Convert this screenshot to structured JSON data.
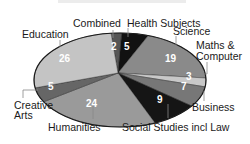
{
  "chart_data": {
    "type": "pie",
    "title": "",
    "unit": "",
    "slices": [
      {
        "label": "Combined",
        "value": 2,
        "color": "#555555"
      },
      {
        "label": "Health Subjects",
        "value": 5,
        "color": "#111111"
      },
      {
        "label": "Science",
        "value": 19,
        "color": "#8a8a8a"
      },
      {
        "label": "Maths & Computer",
        "value": 3,
        "color": "#c8c8c8"
      },
      {
        "label": "Business",
        "value": 7,
        "color": "#777777"
      },
      {
        "label": "Social Studies incl Law",
        "value": 9,
        "color": "#151515"
      },
      {
        "label": "Humanities",
        "value": 24,
        "color": "#9a9a9a"
      },
      {
        "label": "Creative Arts",
        "value": 5,
        "color": "#666666"
      },
      {
        "label": "Education",
        "value": 26,
        "color": "#c4c4c4"
      }
    ],
    "total": 100,
    "legend": "none (direct labels with leader lines)",
    "style": "3D-tilted elliptical pie"
  },
  "labels": {
    "combined": "Combined",
    "health": "Health Subjects",
    "science": "Science",
    "maths_1": "Maths &",
    "maths_2": "Computer",
    "business": "Business",
    "social": "Social Studies incl Law",
    "humanities": "Humanities",
    "creative_1": "Creative",
    "creative_2": "Arts",
    "education": "Education"
  },
  "values": {
    "combined": "2",
    "health": "5",
    "science": "19",
    "maths": "3",
    "business": "7",
    "social": "9",
    "humanities": "24",
    "creative": "5",
    "education": "26"
  }
}
